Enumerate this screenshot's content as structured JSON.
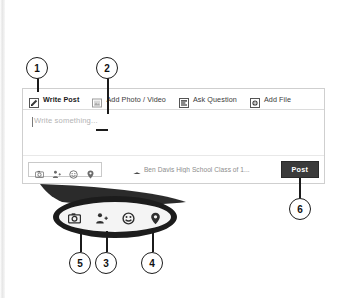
{
  "widget": {
    "name": "post-composer",
    "tabs": [
      {
        "label": "Write Post",
        "icon": "pencil-icon",
        "active": true
      },
      {
        "label": "Add Photo / Video",
        "icon": "photo-icon",
        "active": false
      },
      {
        "label": "Ask Question",
        "icon": "question-list-icon",
        "active": false
      },
      {
        "label": "Add File",
        "icon": "add-file-icon",
        "active": false
      }
    ],
    "editor": {
      "placeholder": "Write something...",
      "value": ""
    },
    "toolbar_icons": [
      {
        "name": "camera-icon",
        "label": "Photo/Video"
      },
      {
        "name": "tag-person-icon",
        "label": "Tag People"
      },
      {
        "name": "emoji-icon",
        "label": "Feeling/Activity"
      },
      {
        "name": "location-icon",
        "label": "Check In"
      }
    ],
    "audience": {
      "icon": "graduation-cap-icon",
      "text": "Ben Davis High School Class of 1..."
    },
    "post_button": {
      "label": "Post",
      "background": "#3b3b3b",
      "color": "#ffffff"
    }
  },
  "magnifier": {
    "icons": [
      {
        "name": "camera-icon"
      },
      {
        "name": "tag-person-icon"
      },
      {
        "name": "emoji-icon"
      },
      {
        "name": "location-icon"
      }
    ]
  },
  "callouts": [
    {
      "number": "1",
      "target": "write-post-tab"
    },
    {
      "number": "2",
      "target": "add-photo-video-tab"
    },
    {
      "number": "3",
      "target": "tag-person-icon"
    },
    {
      "number": "4",
      "target": "location-icon"
    },
    {
      "number": "5",
      "target": "camera-icon"
    },
    {
      "number": "6",
      "target": "post-button"
    }
  ],
  "colors": {
    "annotation": "#1b1b1b",
    "panel_border": "#cfcfcf",
    "placeholder": "#b4b4b4"
  }
}
